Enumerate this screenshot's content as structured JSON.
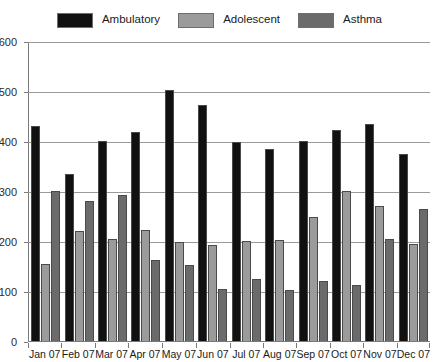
{
  "chart_data": {
    "type": "bar",
    "title": "",
    "subtitle": "",
    "xlabel": "",
    "ylabel": "",
    "ylim": [
      0,
      600
    ],
    "yticks": [
      0,
      100,
      200,
      300,
      400,
      500,
      600
    ],
    "ytick_labels": [
      "0",
      "100",
      "200",
      "300",
      "400",
      "500",
      "600"
    ],
    "grid": true,
    "legend_position": "top-center",
    "categories": [
      "Jan 07",
      "Feb 07",
      "Mar 07",
      "Apr 07",
      "May 07",
      "Jun 07",
      "Jul 07",
      "Aug 07",
      "Sep 07",
      "Oct 07",
      "Nov 07",
      "Dec 07"
    ],
    "series": [
      {
        "name": "Ambulatory",
        "color": "#111111",
        "values": [
          430,
          335,
          400,
          418,
          502,
          472,
          398,
          385,
          400,
          422,
          435,
          375
        ]
      },
      {
        "name": "Adolescent",
        "color": "#9b9b9b",
        "values": [
          155,
          220,
          205,
          222,
          198,
          192,
          200,
          202,
          248,
          300,
          270,
          195
        ]
      },
      {
        "name": "Asthma",
        "color": "#6b6b6b",
        "values": [
          300,
          280,
          293,
          162,
          152,
          105,
          125,
          103,
          120,
          113,
          205,
          265
        ]
      }
    ]
  },
  "legend": {
    "items": [
      {
        "label": "Ambulatory",
        "color": "#111111"
      },
      {
        "label": "Adolescent",
        "color": "#9b9b9b"
      },
      {
        "label": "Asthma",
        "color": "#6b6b6b"
      }
    ]
  },
  "colors": {
    "background": "#ffffff",
    "axis": "#7a7a7a",
    "gridline": "#9a9a9a",
    "text": "#1a1a1a"
  }
}
